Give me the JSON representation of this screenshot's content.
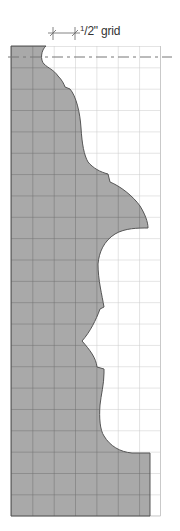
{
  "diagram": {
    "scale_label": {
      "numerator": "1",
      "rest": "/2\" grid"
    },
    "grid": {
      "cell_size_label": "1/2\"",
      "columns": 7,
      "rows": 22,
      "origin_x": 11,
      "origin_y": 46,
      "cell_px": 21.35
    },
    "colors": {
      "profile_fill": "#a9a9a9",
      "profile_grid_line": "#6f6f6f",
      "grid_line": "#c9c9c9",
      "outline": "#555555",
      "centerline": "#777777",
      "dimension_line": "#666666"
    }
  }
}
